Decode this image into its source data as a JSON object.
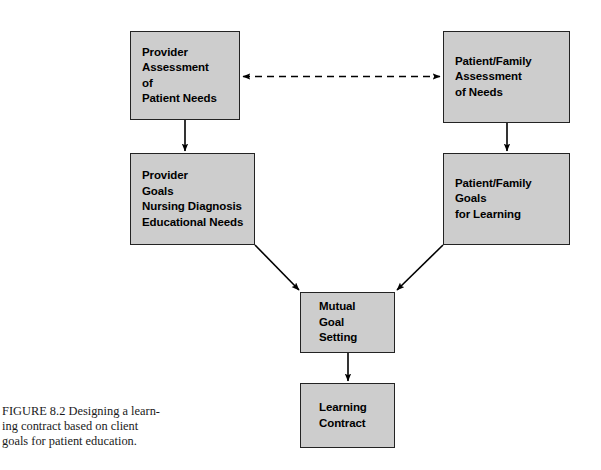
{
  "figure": {
    "caption": "FIGURE 8.2 Designing a learn-\ning contract based on client\ngoals for patient education.",
    "box_fill_color": "#cdcdcd",
    "box_border_color": "#232323",
    "connector_color": "#000000",
    "background_color": "#ffffff"
  },
  "diagram": {
    "type": "flowchart",
    "nodes": [
      {
        "id": "provider-assessment",
        "label": "Provider\nAssessment\nof\nPatient Needs"
      },
      {
        "id": "patient-assessment",
        "label": "Patient/Family\nAssessment\nof Needs"
      },
      {
        "id": "provider-goals",
        "label": "Provider\nGoals\nNursing Diagnosis\nEducational Needs"
      },
      {
        "id": "patient-goals",
        "label": "Patient/Family\nGoals\nfor Learning"
      },
      {
        "id": "mutual-goal",
        "label": "Mutual\nGoal\nSetting"
      },
      {
        "id": "learning-contract",
        "label": "Learning\nContract"
      }
    ],
    "edges": [
      {
        "id": "assessment-link",
        "from": "provider-assessment",
        "to": "patient-assessment",
        "style": "dashed",
        "arrows": "both"
      },
      {
        "id": "provider-down",
        "from": "provider-assessment",
        "to": "provider-goals",
        "style": "solid",
        "arrows": "end"
      },
      {
        "id": "patient-down",
        "from": "patient-assessment",
        "to": "patient-goals",
        "style": "solid",
        "arrows": "end"
      },
      {
        "id": "provider-to-mutual",
        "from": "provider-goals",
        "to": "mutual-goal",
        "style": "solid",
        "arrows": "end"
      },
      {
        "id": "patient-to-mutual",
        "from": "patient-goals",
        "to": "mutual-goal",
        "style": "solid",
        "arrows": "end"
      },
      {
        "id": "mutual-to-contract",
        "from": "mutual-goal",
        "to": "learning-contract",
        "style": "solid",
        "arrows": "end"
      }
    ]
  }
}
